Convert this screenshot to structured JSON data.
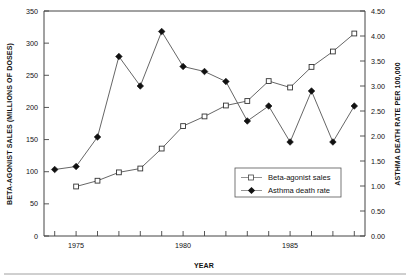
{
  "chart_data": {
    "type": "line",
    "title": "",
    "xlabel": "YEAR",
    "ylabel": "BETA-AGONIST SALES (MILLIONS OF DOSES)",
    "y2label": "ASTHMA DEATH RATE PER 100,000",
    "x": [
      1974,
      1975,
      1976,
      1977,
      1978,
      1979,
      1980,
      1981,
      1982,
      1983,
      1984,
      1985,
      1986,
      1987,
      1988
    ],
    "xlim": [
      1973.5,
      1988.5
    ],
    "xticks": [
      1974,
      1975,
      1976,
      1977,
      1978,
      1979,
      1980,
      1981,
      1982,
      1983,
      1984,
      1985,
      1986,
      1987,
      1988
    ],
    "xtick_labels": [
      "",
      "1975",
      "",
      "",
      "",
      "",
      "1980",
      "",
      "",
      "",
      "",
      "1985",
      "",
      "",
      ""
    ],
    "ylim": [
      0,
      350
    ],
    "yticks": [
      0,
      50,
      100,
      150,
      200,
      250,
      300,
      350
    ],
    "ytick_labels": [
      "0",
      "50",
      "100",
      "150",
      "200",
      "250",
      "300",
      "350"
    ],
    "y2lim": [
      0.0,
      4.5
    ],
    "y2ticks": [
      0.0,
      0.5,
      1.0,
      1.5,
      2.0,
      2.5,
      3.0,
      3.5,
      4.0,
      4.5
    ],
    "y2tick_labels": [
      "0.00",
      "0.50",
      "1.00",
      "1.50",
      "2.00",
      "2.50",
      "3.00",
      "3.50",
      "4.00",
      "4.50"
    ],
    "grid": false,
    "legend_position": "lower-right",
    "series": [
      {
        "name": "Beta-agonist sales",
        "axis": "left",
        "marker": "open-square",
        "x": [
          1975,
          1976,
          1977,
          1978,
          1979,
          1980,
          1981,
          1982,
          1983,
          1984,
          1985,
          1986,
          1987,
          1988
        ],
        "values": [
          77,
          86,
          99,
          105,
          136,
          171,
          186,
          203,
          210,
          241,
          231,
          263,
          287,
          315
        ]
      },
      {
        "name": "Asthma death rate",
        "axis": "right",
        "marker": "filled-diamond",
        "x": [
          1974,
          1975,
          1976,
          1977,
          1978,
          1979,
          1980,
          1981,
          1982,
          1983,
          1984,
          1985,
          1986,
          1987,
          1988
        ],
        "values": [
          1.33,
          1.39,
          1.98,
          3.59,
          3.0,
          4.09,
          3.39,
          3.29,
          3.09,
          2.3,
          2.6,
          1.88,
          2.9,
          1.88,
          2.6
        ]
      }
    ]
  },
  "legend": {
    "items": [
      {
        "label": "Beta-agonist sales",
        "marker": "open-square"
      },
      {
        "label": "Asthma death rate",
        "marker": "filled-diamond"
      }
    ]
  },
  "colors": {
    "line": "#555555",
    "marker_fill": "#111111",
    "axis": "#444444",
    "background": "#ffffff"
  }
}
